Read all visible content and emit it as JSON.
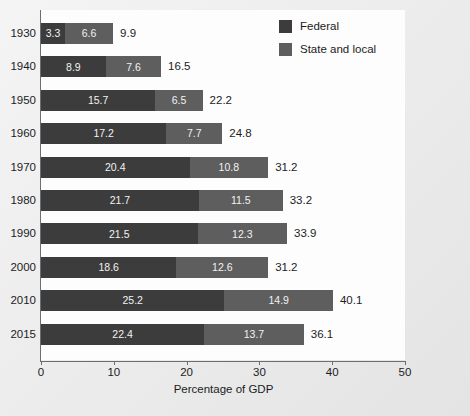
{
  "chart_data": {
    "type": "bar",
    "orientation": "horizontal",
    "stacked": true,
    "title": "",
    "xlabel": "Percentage of GDP",
    "ylabel": "",
    "xlim": [
      0,
      50
    ],
    "xticks": [
      0,
      10,
      20,
      30,
      40,
      50
    ],
    "xtick_labels": [
      "0",
      "10",
      "20",
      "30",
      "40",
      "50"
    ],
    "grid": false,
    "legend_position": "top-right",
    "categories": [
      "1930",
      "1940",
      "1950",
      "1960",
      "1970",
      "1980",
      "1990",
      "2000",
      "2010",
      "2015"
    ],
    "series": [
      {
        "name": "Federal",
        "color": "#3c3c3c",
        "values": [
          3.3,
          8.9,
          15.7,
          17.2,
          20.4,
          21.7,
          21.5,
          18.6,
          25.2,
          22.4
        ]
      },
      {
        "name": "State and local",
        "color": "#5e5e5e",
        "values": [
          6.6,
          7.6,
          6.5,
          7.7,
          10.8,
          11.5,
          12.3,
          12.6,
          14.9,
          13.7
        ]
      }
    ],
    "totals": [
      9.9,
      16.5,
      22.2,
      24.8,
      31.2,
      33.2,
      33.9,
      31.2,
      40.1,
      36.1
    ],
    "rows": [
      {
        "category": "1930",
        "federal": "3.3",
        "state": "6.6",
        "total": "9.9"
      },
      {
        "category": "1940",
        "federal": "8.9",
        "state": "7.6",
        "total": "16.5"
      },
      {
        "category": "1950",
        "federal": "15.7",
        "state": "6.5",
        "total": "22.2"
      },
      {
        "category": "1960",
        "federal": "17.2",
        "state": "7.7",
        "total": "24.8"
      },
      {
        "category": "1970",
        "federal": "20.4",
        "state": "10.8",
        "total": "31.2"
      },
      {
        "category": "1980",
        "federal": "21.7",
        "state": "11.5",
        "total": "33.2"
      },
      {
        "category": "1990",
        "federal": "21.5",
        "state": "12.3",
        "total": "33.9"
      },
      {
        "category": "2000",
        "federal": "18.6",
        "state": "12.6",
        "total": "31.2"
      },
      {
        "category": "2010",
        "federal": "25.2",
        "state": "14.9",
        "total": "40.1"
      },
      {
        "category": "2015",
        "federal": "22.4",
        "state": "13.7",
        "total": "36.1"
      }
    ],
    "legend": [
      {
        "label": "Federal",
        "color": "#3c3c3c"
      },
      {
        "label": "State and local",
        "color": "#5e5e5e"
      }
    ]
  }
}
